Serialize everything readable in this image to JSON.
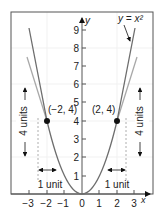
{
  "figure": {
    "curve_label": "y = x²",
    "axis_x_label": "x",
    "axis_y_label": "y",
    "x_ticks": [
      "−3",
      "−2",
      "−1",
      "0",
      "1",
      "2",
      "3"
    ],
    "y_ticks": [
      "1",
      "2",
      "3",
      "4",
      "5",
      "6",
      "7",
      "8",
      "9"
    ],
    "point_left_label": "(−2, 4)",
    "point_right_label": "(2, 4)",
    "vertical_annotation_left": "4 units",
    "vertical_annotation_right": "4 units",
    "horizontal_annotation_left": "1 unit",
    "horizontal_annotation_right": "1 unit",
    "colors": {
      "frame": "#555555",
      "curve_dark": "#6e6e6e",
      "curve_light": "#a8a8a8",
      "axis": "#555555",
      "point": "#111111",
      "grid": "#f0f0f0"
    }
  }
}
